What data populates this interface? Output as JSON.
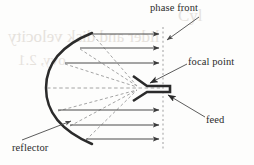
{
  "figure": {
    "background_color": "#fdfdfc",
    "ink_color": "#2b2b2b",
    "ray_color": "#595959",
    "dash_color": "#8c8c8c",
    "ghost_color": "#e6e2dc"
  },
  "labels": {
    "phase_front": "phase front",
    "focal_point": "focal point",
    "feed": "feed",
    "reflector": "reflector"
  },
  "ghost_text": {
    "line1": "Cyl",
    "line2": "lider and disk velocity",
    "line3": "ovy, 2.1"
  },
  "geometry": {
    "reflector": {
      "type": "parabolic-arc",
      "apex_x": 48,
      "apex_y": 88,
      "top_x": 92,
      "top_y": 34,
      "bottom_x": 92,
      "bottom_y": 143,
      "stroke_width": 2.4
    },
    "focal_point": {
      "x": 140,
      "y": 88
    },
    "phase_front": {
      "x": 163,
      "y_top": 28,
      "y_bottom": 150,
      "style": "dashed-vertical"
    },
    "feed": {
      "x": 140,
      "y": 88,
      "shape": "horn-waveguide",
      "mouth_half_height": 13,
      "waveguide_length": 22
    },
    "parallel_rays": [
      {
        "id": 1,
        "y": 34,
        "x_start": 92,
        "x_end": 162,
        "style": "solid"
      },
      {
        "id": 2,
        "y": 48,
        "x_start": 80,
        "x_end": 162,
        "style": "solid"
      },
      {
        "id": 3,
        "y": 63,
        "x_start": 65,
        "x_end": 162,
        "style": "solid"
      },
      {
        "id": 4,
        "y": 88,
        "x_start": 48,
        "x_end": 162,
        "style": "dashed-axis"
      },
      {
        "id": 5,
        "y": 110,
        "x_start": 58,
        "x_end": 162,
        "style": "solid"
      },
      {
        "id": 6,
        "y": 125,
        "x_start": 70,
        "x_end": 162,
        "style": "solid"
      },
      {
        "id": 7,
        "y": 139,
        "x_start": 85,
        "x_end": 162,
        "style": "solid"
      }
    ],
    "feed_rays": [
      {
        "id": 1,
        "from_x": 92,
        "from_y": 34,
        "to_x": 138,
        "to_y": 87
      },
      {
        "id": 2,
        "from_x": 80,
        "from_y": 48,
        "to_x": 138,
        "to_y": 87
      },
      {
        "id": 3,
        "from_x": 65,
        "from_y": 63,
        "to_x": 138,
        "to_y": 87
      },
      {
        "id": 4,
        "from_x": 58,
        "from_y": 110,
        "to_x": 138,
        "to_y": 89
      },
      {
        "id": 5,
        "from_x": 70,
        "from_y": 125,
        "to_x": 138,
        "to_y": 89
      },
      {
        "id": 6,
        "from_x": 85,
        "from_y": 139,
        "to_x": 138,
        "to_y": 89
      }
    ],
    "leader_lines": [
      {
        "name": "phase-front-leader",
        "from_x": 199,
        "from_y": 17,
        "to_x": 166,
        "to_y": 40
      },
      {
        "name": "focal-point-leader",
        "from_x": 186,
        "from_y": 64,
        "to_x": 147,
        "to_y": 84
      },
      {
        "name": "feed-leader",
        "from_x": 204,
        "from_y": 117,
        "to_x": 167,
        "to_y": 95
      },
      {
        "name": "reflector-leader",
        "from_x": 22,
        "from_y": 141,
        "to_x": 72,
        "to_y": 122
      }
    ]
  }
}
